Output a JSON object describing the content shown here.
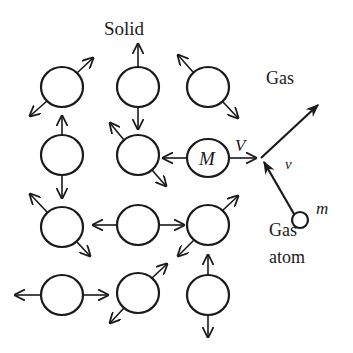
{
  "diagram": {
    "title": "Solid",
    "labels": {
      "solid": "Solid",
      "gas": "Gas",
      "gas_atom_line1": "Gas",
      "gas_atom_line2": "atom",
      "mass_large": "M",
      "velocity_large": "V",
      "velocity_small": "v",
      "mass_small": "m"
    },
    "colors": {
      "stroke": "#1a1a1a",
      "background": "#ffffff"
    },
    "atoms": [
      {
        "id": "r1c1",
        "cx": 62,
        "cy": 87
      },
      {
        "id": "r1c2",
        "cx": 138,
        "cy": 87
      },
      {
        "id": "r1c3",
        "cx": 208,
        "cy": 87
      },
      {
        "id": "r2c1",
        "cx": 62,
        "cy": 155
      },
      {
        "id": "r2c2",
        "cx": 138,
        "cy": 155
      },
      {
        "id": "r2c3-M",
        "cx": 208,
        "cy": 158
      },
      {
        "id": "r3c1",
        "cx": 62,
        "cy": 227
      },
      {
        "id": "r3c2",
        "cx": 138,
        "cy": 225
      },
      {
        "id": "r3c3",
        "cx": 208,
        "cy": 225
      },
      {
        "id": "r4c1",
        "cx": 62,
        "cy": 295
      },
      {
        "id": "r4c2",
        "cx": 138,
        "cy": 293
      },
      {
        "id": "r4c3",
        "cx": 208,
        "cy": 295
      }
    ],
    "gas_atom": {
      "cx": 300,
      "cy": 220,
      "r": 8
    }
  }
}
